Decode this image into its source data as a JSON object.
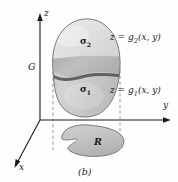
{
  "figure": {
    "caption": "(b)",
    "axes": {
      "z_label": "z",
      "y_label": "y",
      "x_label": "x"
    },
    "solid": {
      "label": "G",
      "upper_surface_label": "σ",
      "upper_surface_sub": "2",
      "lower_surface_label": "σ",
      "lower_surface_sub": "1"
    },
    "equations": {
      "upper": {
        "lhs": "z = g",
        "sub": "2",
        "rhs": "(x, y)"
      },
      "lower": {
        "lhs": "z = g",
        "sub": "1",
        "rhs": "(x, y)"
      }
    },
    "region": {
      "label": "R"
    },
    "colors": {
      "background": "#fefefe",
      "ink": "#1a1a1a",
      "upper_surface_fill": "#dedede",
      "band_fill": "#b4b4b4",
      "lower_surface_fill": "#c9c9c9",
      "region_fill": "#c4c4c4",
      "outline": "#666666",
      "dashed": "#8c8c8c"
    }
  }
}
